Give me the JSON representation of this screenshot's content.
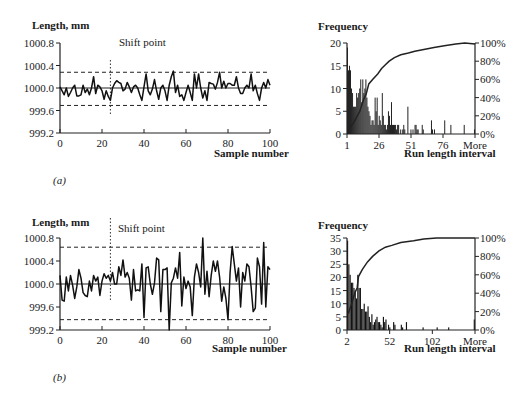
{
  "chart_data": [
    {
      "id": "a_timeseries",
      "type": "line",
      "panel_label": "(a)",
      "title": "",
      "ylabel": "Length, mm",
      "xlabel": "Sample number",
      "xlim": [
        0,
        100
      ],
      "ylim": [
        999.2,
        1000.8
      ],
      "xticks": [
        0,
        20,
        40,
        60,
        80,
        100
      ],
      "yticks": [
        "999.2",
        "999.6",
        "1000.0",
        "1000.4",
        "1000.8"
      ],
      "center_line": 1000.0,
      "ucl": 1000.28,
      "lcl": 999.69,
      "shift_point": 24,
      "annotation": "Shift point",
      "grid": false,
      "series": [
        {
          "name": "Length",
          "x": [
            0,
            1,
            2,
            3,
            4,
            5,
            6,
            7,
            8,
            9,
            10,
            11,
            12,
            13,
            14,
            15,
            16,
            17,
            18,
            19,
            20,
            21,
            22,
            23,
            24,
            25,
            26,
            27,
            28,
            29,
            30,
            31,
            32,
            33,
            34,
            35,
            36,
            37,
            38,
            39,
            40,
            41,
            42,
            43,
            44,
            45,
            46,
            47,
            48,
            49,
            50,
            51,
            52,
            53,
            54,
            55,
            56,
            57,
            58,
            59,
            60,
            61,
            62,
            63,
            64,
            65,
            66,
            67,
            68,
            69,
            70,
            71,
            72,
            73,
            74,
            75,
            76,
            77,
            78,
            79,
            80,
            81,
            82,
            83,
            84,
            85,
            86,
            87,
            88,
            89,
            90,
            91,
            92,
            93,
            94,
            95,
            96,
            97,
            98,
            99,
            100
          ],
          "values": [
            1000.02,
            999.95,
            999.88,
            1000.0,
            999.85,
            999.92,
            1000.0,
            1000.05,
            999.86,
            999.86,
            999.88,
            1000.05,
            999.92,
            999.98,
            999.88,
            1000.0,
            1000.2,
            999.9,
            1000.05,
            1000.02,
            999.95,
            999.8,
            999.95,
            999.85,
            999.78,
            1000.0,
            1000.08,
            1000.13,
            1000.1,
            1000.08,
            999.95,
            999.98,
            1000.1,
            1000.02,
            999.92,
            1000.02,
            1000.05,
            1000.0,
            999.88,
            999.78,
            1000.02,
            1000.25,
            999.95,
            999.88,
            999.98,
            1000.15,
            999.95,
            999.8,
            1000.0,
            1000.05,
            999.95,
            999.78,
            1000.05,
            1000.2,
            1000.3,
            999.92,
            1000.05,
            999.85,
            999.88,
            999.78,
            999.92,
            1000.05,
            999.92,
            999.78,
            1000.25,
            1000.0,
            1000.25,
            1000.0,
            999.82,
            999.95,
            999.78,
            1000.1,
            1000.08,
            1000.07,
            999.98,
            1000.1,
            1000.28,
            1000.0,
            1000.12,
            1000.0,
            1000.08,
            1000.08,
            1000.05,
            1000.05,
            1000.2,
            1000.0,
            999.9,
            999.9,
            1000.0,
            1000.05,
            1000.0,
            1000.25,
            999.95,
            1000.05,
            999.9,
            999.78,
            1000.0,
            1000.1,
            1000.0,
            1000.15,
            1000.05
          ]
        }
      ]
    },
    {
      "id": "a_histogram",
      "type": "bar",
      "title": "",
      "ylabel": "Frequency",
      "xlabel": "Run length interval",
      "ylim": [
        0,
        20
      ],
      "yticks": [
        0,
        5,
        10,
        15,
        20
      ],
      "y2ticks": [
        "0%",
        "20%",
        "40%",
        "60%",
        "80%",
        "100%"
      ],
      "xtick_labels": [
        "1",
        "26",
        "51",
        "76",
        "More"
      ],
      "series": [
        {
          "name": "Frequency",
          "values": [
            19,
            14,
            15,
            14,
            10,
            9,
            6,
            6,
            6,
            9,
            8,
            9,
            10,
            12,
            7,
            12,
            9,
            10,
            12,
            8,
            6,
            5,
            4,
            2,
            3,
            3,
            2,
            8,
            5,
            8,
            2,
            4,
            3,
            2,
            9,
            4,
            2,
            2,
            1,
            2,
            5,
            4,
            2,
            7,
            2,
            2,
            2,
            2,
            1,
            2,
            2,
            0,
            1,
            0,
            1,
            2,
            1,
            0,
            0,
            6,
            0,
            0,
            1,
            0,
            1,
            0,
            2,
            2,
            1,
            1,
            0,
            0,
            0,
            2,
            1,
            0,
            0,
            0,
            0,
            0,
            0,
            0,
            3,
            1,
            0,
            1,
            0,
            0,
            0,
            0,
            0,
            0,
            0,
            0,
            0,
            3,
            0,
            0,
            0,
            0,
            0,
            2,
            0,
            0,
            0,
            0,
            0,
            0,
            0,
            0,
            0,
            0,
            0,
            0,
            2,
            0,
            0,
            0,
            0,
            0,
            0,
            0,
            0,
            0,
            1
          ]
        },
        {
          "name": "Cumulative %",
          "type": "line",
          "points_pct": [
            [
              1,
              5
            ],
            [
              5,
              12
            ],
            [
              10,
              25
            ],
            [
              13,
              38
            ],
            [
              15,
              44
            ],
            [
              17,
              55
            ],
            [
              20,
              60
            ],
            [
              24,
              66
            ],
            [
              27,
              72
            ],
            [
              30,
              76
            ],
            [
              33,
              80
            ],
            [
              37,
              84
            ],
            [
              42,
              87
            ],
            [
              48,
              89
            ],
            [
              53,
              91
            ],
            [
              60,
              93
            ],
            [
              68,
              95
            ],
            [
              76,
              97
            ],
            [
              85,
              99
            ],
            [
              92,
              100
            ],
            [
              100,
              99
            ]
          ]
        }
      ]
    },
    {
      "id": "b_timeseries",
      "type": "line",
      "panel_label": "(b)",
      "title": "",
      "ylabel": "Length, mm",
      "xlabel": "Sample  number",
      "xlim": [
        0,
        100
      ],
      "ylim": [
        999.2,
        1000.8
      ],
      "xticks": [
        0,
        20,
        40,
        60,
        80,
        100
      ],
      "yticks": [
        "999.2",
        "999.6",
        "1000.0",
        "1000.4",
        "1000.8"
      ],
      "center_line": 1000.0,
      "ucl": 1000.64,
      "lcl": 999.38,
      "shift_point": 24,
      "annotation": "Shift point",
      "grid": false,
      "series": [
        {
          "name": "Length",
          "x": [
            0,
            1,
            2,
            3,
            4,
            5,
            6,
            7,
            8,
            9,
            10,
            11,
            12,
            13,
            14,
            15,
            16,
            17,
            18,
            19,
            20,
            21,
            22,
            23,
            24,
            25,
            26,
            27,
            28,
            29,
            30,
            31,
            32,
            33,
            34,
            35,
            36,
            37,
            38,
            39,
            40,
            41,
            42,
            43,
            44,
            45,
            46,
            47,
            48,
            49,
            50,
            51,
            52,
            53,
            54,
            55,
            56,
            57,
            58,
            59,
            60,
            61,
            62,
            63,
            64,
            65,
            66,
            67,
            68,
            69,
            70,
            71,
            72,
            73,
            74,
            75,
            76,
            77,
            78,
            79,
            80,
            81,
            82,
            83,
            84,
            85,
            86,
            87,
            88,
            89,
            90,
            91,
            92,
            93,
            94,
            95,
            96,
            97,
            98,
            99,
            100
          ],
          "values": [
            1000.15,
            999.72,
            999.7,
            1000.12,
            999.88,
            1000.15,
            999.98,
            999.75,
            999.95,
            1000.25,
            1000.1,
            999.85,
            999.8,
            999.78,
            1000.05,
            999.88,
            1000.15,
            1000.05,
            1000.12,
            999.8,
            1000.05,
            1000.18,
            1000.1,
            1000.15,
            1000.05,
            1000.2,
            1000.0,
            1000.0,
            1000.3,
            1000.15,
            1000.42,
            1000.12,
            1000.2,
            1000.1,
            999.72,
            1000.25,
            999.88,
            999.9,
            999.88,
            1000.35,
            999.42,
            1000.28,
            1000.3,
            1000.0,
            999.82,
            1000.02,
            1000.45,
            1000.42,
            999.52,
            1000.25,
            1000.25,
            1000.28,
            999.2,
            1000.02,
            1000.1,
            1000.28,
            1000.1,
            1000.55,
            999.62,
            1000.12,
            999.92,
            1000.05,
            999.95,
            999.45,
            1000.12,
            1000.35,
            1000.2,
            999.95,
            1000.85,
            999.82,
            1000.22,
            999.78,
            1000.15,
            1000.4,
            1000.22,
            1000.4,
            1000.12,
            999.7,
            999.95,
            999.75,
            999.38,
            1000.2,
            1000.65,
            1000.35,
            1000.05,
            1000.28,
            999.6,
            1000.2,
            1000.05,
            1000.35,
            1000.3,
            999.95,
            999.52,
            999.58,
            1000.45,
            1000.3,
            999.65,
            1000.72,
            999.6,
            1000.3,
            1000.25
          ]
        }
      ]
    },
    {
      "id": "b_histogram",
      "type": "bar",
      "title": "",
      "ylabel": "Frequency",
      "xlabel": "Run length interval",
      "ylim": [
        0,
        35
      ],
      "yticks": [
        0,
        5,
        10,
        15,
        20,
        25,
        30,
        35
      ],
      "y2ticks": [
        "0%",
        "20%",
        "40%",
        "60%",
        "80%",
        "100%"
      ],
      "xtick_labels": [
        "2",
        "52",
        "102",
        "More"
      ],
      "series": [
        {
          "name": "Frequency",
          "values": [
            34,
            25,
            21,
            18,
            18,
            16,
            15,
            12,
            21,
            16,
            16,
            8,
            8,
            10,
            7,
            7,
            9,
            5,
            3,
            6,
            2,
            3,
            4,
            5,
            3,
            3,
            2,
            1,
            5,
            3,
            4,
            0,
            2,
            1,
            0,
            0,
            3,
            2,
            0,
            0,
            0,
            0,
            2,
            1,
            0,
            0,
            3,
            0,
            0,
            0,
            0,
            0,
            0,
            0,
            0,
            0,
            0,
            0,
            0,
            1,
            0,
            0,
            0,
            0,
            0,
            0,
            0,
            0,
            0,
            0,
            1,
            0,
            0,
            0,
            0,
            0,
            0,
            0,
            0,
            1,
            0,
            0,
            0,
            0,
            0,
            0,
            0,
            0,
            0,
            0,
            0,
            0,
            0,
            0,
            0,
            0,
            0,
            0,
            0,
            4
          ]
        },
        {
          "name": "Cumulative %",
          "type": "line",
          "points_pct": [
            [
              1,
              18
            ],
            [
              4,
              30
            ],
            [
              6,
              40
            ],
            [
              8,
              46
            ],
            [
              9,
              58
            ],
            [
              12,
              66
            ],
            [
              16,
              74
            ],
            [
              20,
              80
            ],
            [
              25,
              86
            ],
            [
              30,
              90
            ],
            [
              35,
              92
            ],
            [
              42,
              95
            ],
            [
              52,
              97
            ],
            [
              60,
              99
            ],
            [
              70,
              100
            ],
            [
              100,
              100
            ]
          ]
        }
      ]
    }
  ],
  "labels": {
    "a_panel": "(a)",
    "b_panel": "(b)",
    "a_ylabel": "Length, mm",
    "b_ylabel": "Length, mm",
    "a_xlabel": "Sample number",
    "b_xlabel": "Sample  number",
    "a_shift": "Shift point",
    "b_shift": "Shift point",
    "a_hist_ylabel": "Frequency",
    "b_hist_ylabel": "Frequency",
    "a_hist_xlabel": "Run length interval",
    "b_hist_xlabel": "Run length interval"
  }
}
